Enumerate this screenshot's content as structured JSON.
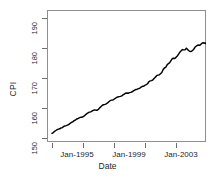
{
  "chart_data": {
    "type": "line",
    "title": "",
    "xlabel": "Date",
    "ylabel": "CPI",
    "grid": false,
    "legend": null,
    "xlim": [
      "Jan-1993",
      "Jan-2005"
    ],
    "ylim": [
      147,
      193
    ],
    "y_ticks": [
      150,
      160,
      170,
      180,
      190
    ],
    "x_ticks": [
      "Jan-1993",
      "Jan-1995",
      "Jan-1997",
      "Jan-1999",
      "Jan-2001",
      "Jan-2003",
      "Jan-2005"
    ],
    "x_tick_labels_shown": [
      "Jan-1995",
      "Jan-1999",
      "Jan-2003"
    ],
    "series": [
      {
        "name": "CPI observed",
        "style": "solid-jagged",
        "x": [
          "1993-01",
          "1993-02",
          "1993-03",
          "1993-04",
          "1993-05",
          "1993-06",
          "1993-07",
          "1993-08",
          "1993-09",
          "1993-10",
          "1993-11",
          "1993-12",
          "1994-01",
          "1994-02",
          "1994-03",
          "1994-04",
          "1994-05",
          "1994-06",
          "1994-07",
          "1994-08",
          "1994-09",
          "1994-10",
          "1994-11",
          "1994-12",
          "1995-01",
          "1995-02",
          "1995-03",
          "1995-04",
          "1995-05",
          "1995-06",
          "1995-07",
          "1995-08",
          "1995-09",
          "1995-10",
          "1995-11",
          "1995-12",
          "1996-01",
          "1996-02",
          "1996-03",
          "1996-04",
          "1996-05",
          "1996-06",
          "1996-07",
          "1996-08",
          "1996-09",
          "1996-10",
          "1996-11",
          "1996-12",
          "1997-01",
          "1997-02",
          "1997-03",
          "1997-04",
          "1997-05",
          "1997-06",
          "1997-07",
          "1997-08",
          "1997-09",
          "1997-10",
          "1997-11",
          "1997-12",
          "1998-01",
          "1998-02",
          "1998-03",
          "1998-04",
          "1998-05",
          "1998-06",
          "1998-07",
          "1998-08",
          "1998-09",
          "1998-10",
          "1998-11",
          "1998-12",
          "1999-01",
          "1999-02",
          "1999-03",
          "1999-04",
          "1999-05",
          "1999-06",
          "1999-07",
          "1999-08",
          "1999-09",
          "1999-10",
          "1999-11",
          "1999-12",
          "2000-01",
          "2000-02",
          "2000-03",
          "2000-04",
          "2000-05",
          "2000-06",
          "2000-07",
          "2000-08",
          "2000-09",
          "2000-10",
          "2000-11",
          "2000-12",
          "2001-01",
          "2001-02",
          "2001-03",
          "2001-04",
          "2001-05",
          "2001-06",
          "2001-07",
          "2001-08",
          "2001-09",
          "2001-10",
          "2001-11",
          "2001-12",
          "2002-01",
          "2002-02",
          "2002-03",
          "2002-04",
          "2002-05",
          "2002-06",
          "2002-07",
          "2002-08",
          "2002-09",
          "2002-10",
          "2002-11",
          "2002-12",
          "2003-01",
          "2003-02",
          "2003-03",
          "2003-04",
          "2003-05",
          "2003-06",
          "2003-07",
          "2003-08",
          "2003-09",
          "2003-10",
          "2003-11",
          "2003-12",
          "2004-01",
          "2004-02",
          "2004-03",
          "2004-04",
          "2004-05"
        ],
        "y": [
          150.0,
          150.3,
          150.7,
          151.0,
          151.3,
          151.5,
          151.6,
          151.9,
          152.0,
          152.4,
          152.6,
          152.7,
          152.9,
          153.1,
          153.5,
          153.8,
          154.0,
          154.4,
          154.6,
          155.0,
          155.1,
          155.4,
          155.6,
          155.6,
          155.8,
          156.1,
          156.5,
          156.9,
          157.2,
          157.4,
          157.5,
          157.8,
          158.0,
          158.2,
          158.1,
          158.1,
          158.4,
          158.9,
          159.4,
          159.8,
          160.0,
          160.1,
          160.3,
          160.6,
          161.0,
          161.4,
          161.6,
          161.6,
          161.9,
          162.2,
          162.5,
          162.7,
          162.8,
          162.9,
          163.1,
          163.4,
          163.7,
          164.0,
          164.1,
          164.0,
          164.2,
          164.3,
          164.5,
          164.8,
          165.1,
          165.3,
          165.4,
          165.6,
          165.8,
          166.1,
          166.4,
          166.4,
          166.8,
          167.0,
          167.3,
          168.0,
          168.3,
          168.4,
          168.6,
          169.1,
          169.6,
          170.1,
          170.3,
          170.4,
          170.8,
          171.2,
          172.2,
          172.8,
          173.0,
          173.8,
          174.3,
          174.6,
          175.3,
          176.0,
          176.2,
          176.1,
          176.5,
          177.0,
          177.6,
          178.3,
          178.8,
          179.2,
          179.1,
          179.1,
          179.7,
          179.2,
          178.8,
          178.5,
          178.6,
          179.0,
          179.5,
          180.2,
          180.5,
          180.8,
          180.7,
          180.9,
          181.4,
          181.6,
          181.5,
          181.3,
          182.0,
          183.0,
          183.8,
          184.1,
          184.0,
          184.1,
          184.2,
          184.7,
          185.3,
          185.4,
          185.2,
          185.0,
          185.7,
          186.4,
          186.9,
          187.3,
          187.8
        ],
        "y_start": 150.0,
        "y_end": 187.8
      },
      {
        "name": "Forecast mean (point forecasts)",
        "style": "open-circles",
        "x": [
          "2004-06",
          "2004-07",
          "2004-08",
          "2004-09",
          "2004-10",
          "2004-11",
          "2004-12",
          "2005-01"
        ],
        "y": [
          188.3,
          188.8,
          189.3,
          189.7,
          190.1,
          190.5,
          190.8,
          191.1
        ]
      },
      {
        "name": "Forecast path 1",
        "style": "solid-thin",
        "x": [
          "2004-05",
          "2005-01"
        ],
        "y": [
          186.6,
          191.3
        ]
      },
      {
        "name": "Forecast path 2",
        "style": "solid-thin",
        "x": [
          "2004-05",
          "2005-01"
        ],
        "y": [
          186.6,
          189.6
        ]
      },
      {
        "name": "Forecast path 3",
        "style": "solid-thin",
        "x": [
          "2004-05",
          "2005-01"
        ],
        "y": [
          186.6,
          188.4
        ]
      },
      {
        "name": "Forecast path 4",
        "style": "solid-thin",
        "x": [
          "2004-05",
          "2005-01"
        ],
        "y": [
          186.6,
          187.1
        ]
      },
      {
        "name": "Forecast path 5",
        "style": "solid-thin",
        "x": [
          "2004-05",
          "2005-01"
        ],
        "y": [
          186.6,
          185.9
        ]
      }
    ],
    "annotations": []
  },
  "axes": {
    "y_title": "CPI",
    "x_title": "Date",
    "y_tick_labels": [
      "150",
      "160",
      "170",
      "180",
      "190"
    ],
    "x_tick_labels": [
      "Jan-1995",
      "Jan-1999",
      "Jan-2003"
    ]
  },
  "figure": {
    "background": "#ffffff",
    "line_color": "#000000",
    "frame_color": "#8f8f8f",
    "tick_color": "#6e6e6e",
    "text_color": "#1f1f1f"
  }
}
